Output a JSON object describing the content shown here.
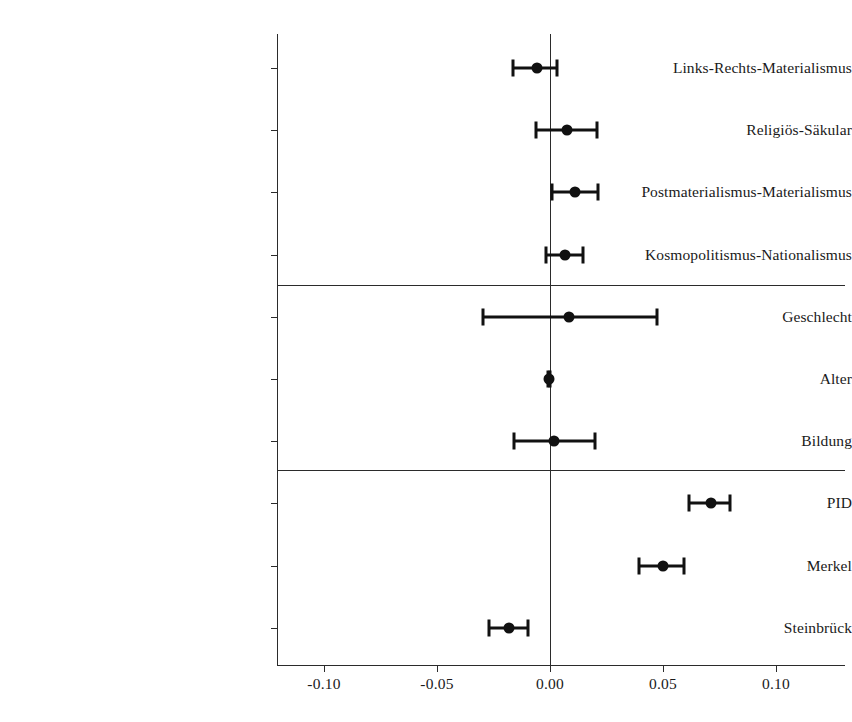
{
  "chart_data": {
    "type": "scatter",
    "subtype": "coefficient-plot",
    "title": "",
    "xlabel": "",
    "ylabel": "",
    "xlim": [
      -0.125,
      0.12
    ],
    "xticks": [
      -0.1,
      -0.05,
      0.0,
      0.05,
      0.1
    ],
    "xtick_labels": [
      "-0.10",
      "-0.05",
      "0.00",
      "0.05",
      "0.10"
    ],
    "grid": false,
    "legend": "none",
    "zero_reference_line": 0.0,
    "group_separators": [
      4,
      7
    ],
    "categories": [
      "Links-Rechts-Materialismus",
      "Religiös-Säkular",
      "Postmaterialismus-Materialismus",
      "Kosmopolitismus-Nationalismus",
      "Geschlecht",
      "Alter",
      "Bildung",
      "PID",
      "Merkel",
      "Steinbrück"
    ],
    "series": [
      {
        "name": "Koeffizient",
        "estimates": [
          -0.0058,
          0.0075,
          0.011,
          0.0066,
          0.0084,
          -0.0003,
          0.0018,
          0.0712,
          0.05,
          -0.0181
        ],
        "ci_low": [
          -0.0164,
          -0.0062,
          0.0009,
          -0.0018,
          -0.0297,
          -0.0008,
          -0.0159,
          0.0615,
          0.0394,
          -0.027
        ],
        "ci_high": [
          0.0031,
          0.0208,
          0.0212,
          0.0146,
          0.0473,
          0.0002,
          0.0199,
          0.0796,
          0.0593,
          -0.0097
        ]
      }
    ],
    "points": [
      {
        "label": "Links-Rechts-Materialismus",
        "estimate": -0.0058,
        "ci_low": -0.0164,
        "ci_high": 0.0031
      },
      {
        "label": "Religiös-Säkular",
        "estimate": 0.0075,
        "ci_low": -0.0062,
        "ci_high": 0.0208
      },
      {
        "label": "Postmaterialismus-Materialismus",
        "estimate": 0.011,
        "ci_low": 0.0009,
        "ci_high": 0.0212
      },
      {
        "label": "Kosmopolitismus-Nationalismus",
        "estimate": 0.0066,
        "ci_low": -0.0018,
        "ci_high": 0.0146
      },
      {
        "label": "Geschlecht",
        "estimate": 0.0084,
        "ci_low": -0.0297,
        "ci_high": 0.0473
      },
      {
        "label": "Alter",
        "estimate": -0.0003,
        "ci_low": -0.0008,
        "ci_high": 0.0002
      },
      {
        "label": "Bildung",
        "estimate": 0.0018,
        "ci_low": -0.0159,
        "ci_high": 0.0199
      },
      {
        "label": "PID",
        "estimate": 0.0712,
        "ci_low": 0.0615,
        "ci_high": 0.0796
      },
      {
        "label": "Merkel",
        "estimate": 0.05,
        "ci_low": 0.0394,
        "ci_high": 0.0593
      },
      {
        "label": "Steinbrück",
        "estimate": -0.0181,
        "ci_low": -0.027,
        "ci_high": -0.0097
      }
    ],
    "colors": {
      "point": "#111111",
      "interval": "#111111",
      "axis": "#2b2b2b",
      "background": "#ffffff"
    }
  }
}
